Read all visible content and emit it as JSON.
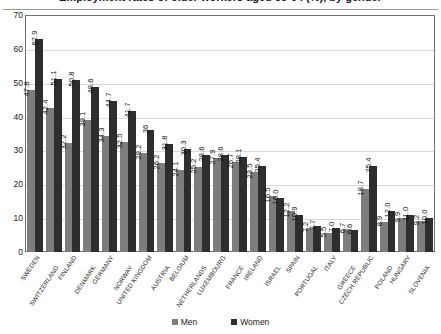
{
  "chart_data": {
    "type": "bar",
    "title": "Employment rates of older workers aged 55-64 (%), by gender",
    "xlabel": "",
    "ylabel": "",
    "ylim": [
      0,
      70
    ],
    "ytick_step": 10,
    "yticks": [
      70,
      60,
      50,
      40,
      30,
      20,
      10,
      0
    ],
    "grid": true,
    "legend_position": "bottom",
    "categories": [
      "SWEDEN",
      "SWITZERLAND",
      "FINLAND",
      "DENMARK",
      "GERMANY",
      "NORWAY",
      "UNITED KINGDOM",
      "AUSTRIA",
      "BELGIUM",
      "NETHERLANDS",
      "LUXEMBOURG",
      "FRANCE",
      "IRELAND",
      "ISRAEL",
      "SPAIN",
      "PORTUGAL",
      "ITALY",
      "GREECE",
      "CZECH REPUBLIC",
      "POLAND",
      "HUNGARY",
      "SLOVENIA"
    ],
    "series": [
      {
        "name": "Men",
        "color": "#7d7d7d",
        "values": [
          47.8,
          42.4,
          32.2,
          39.1,
          34.3,
          32.5,
          29.2,
          26.2,
          24.1,
          25.2,
          27.9,
          26.7,
          23.5,
          16.5,
          12.2,
          7.2,
          5.5,
          6.7,
          18.7,
          8.9,
          9.9,
          9.2
        ]
      },
      {
        "name": "Women",
        "color": "#2e2e2e",
        "values": [
          62.9,
          51.1,
          50.8,
          48.6,
          44.7,
          41.7,
          36.0,
          31.8,
          30.3,
          28.6,
          28.6,
          28.1,
          25.4,
          16.0,
          10.9,
          7.7,
          7.0,
          6.6,
          25.4,
          12.0,
          11.0,
          10.0
        ]
      }
    ],
    "value_labels": {
      "Men": [
        "47.8",
        "42.4",
        "32.2",
        "39.1",
        "34.3",
        "32.5",
        "29.2",
        "26.2",
        "24.1",
        "25.2",
        "27.9",
        "26.7",
        "23.5",
        "16.5",
        "12.2",
        "7.2",
        "5.5",
        "6.7",
        "18.7",
        "8.9",
        "9.9",
        "9.2"
      ],
      "Women": [
        "62.9",
        "51.1",
        "50.8",
        "48.6",
        "44.7",
        "41.7",
        "36",
        "31.8",
        "30.3",
        "28.6",
        "28.6",
        "28.1",
        "25.4",
        "16.0",
        "10.9",
        "7.7",
        "7.0",
        "6.6",
        "25.4",
        "12.0",
        "11.0",
        "10.0"
      ]
    }
  },
  "legend": {
    "men_label": "Men",
    "women_label": "Women"
  }
}
